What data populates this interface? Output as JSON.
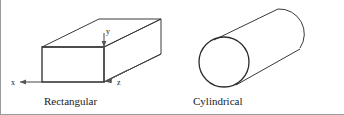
{
  "figure": {
    "background_color": "#ffffff",
    "stroke_color": "#3a3a3a",
    "text_color": "#1a1a1a",
    "frame_color": "#9a9a9a",
    "shapes": [
      {
        "id": "rectangular",
        "caption": "Rectangular",
        "type": "rectangular-prism",
        "axes": [
          {
            "name": "x",
            "label": "x",
            "direction": "left"
          },
          {
            "name": "y",
            "label": "y",
            "direction": "down"
          },
          {
            "name": "z",
            "label": "z",
            "direction": "down-left"
          }
        ]
      },
      {
        "id": "cylindrical",
        "caption": "Cylindrical",
        "type": "cylinder",
        "axes": []
      }
    ]
  }
}
